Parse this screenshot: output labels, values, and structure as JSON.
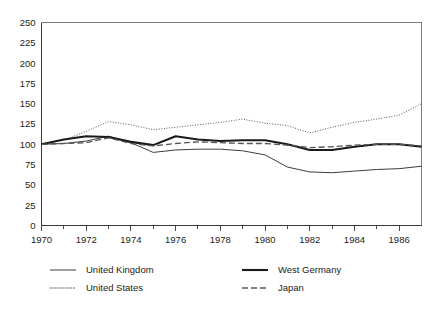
{
  "chart_data": {
    "type": "line",
    "title": "",
    "subtitle": "",
    "xlabel": "",
    "ylabel": "",
    "xlim": [
      1970,
      1987
    ],
    "ylim": [
      0,
      250
    ],
    "ytick_step": 25,
    "grid": false,
    "legend_position": "bottom",
    "yticks": [
      0,
      25,
      50,
      75,
      100,
      125,
      150,
      175,
      200,
      225,
      250
    ],
    "ytick_labels": [
      "0",
      "25",
      "50",
      "75",
      "100",
      "125",
      "150",
      "175",
      "200",
      "225",
      "250"
    ],
    "xticks": [
      1970,
      1971,
      1972,
      1973,
      1974,
      1975,
      1976,
      1977,
      1978,
      1979,
      1980,
      1981,
      1982,
      1983,
      1984,
      1985,
      1986,
      1987
    ],
    "xtick_labels_major": [
      "1970",
      "1972",
      "1974",
      "1976",
      "1978",
      "1980",
      "1982",
      "1984",
      "1986"
    ],
    "x": [
      1970,
      1971,
      1972,
      1973,
      1974,
      1975,
      1976,
      1977,
      1978,
      1979,
      1980,
      1981,
      1982,
      1983,
      1984,
      1985,
      1986,
      1987
    ],
    "series": [
      {
        "name": "United Kingdom",
        "style": "thin-solid",
        "color": "#3d3d3d",
        "width": 1,
        "dash": "none",
        "values": [
          100,
          101,
          104,
          110,
          102,
          90,
          93,
          94,
          94,
          92,
          87,
          72,
          66,
          65,
          67,
          69,
          70,
          73
        ]
      },
      {
        "name": "United States",
        "style": "dotted",
        "color": "#5a5a5a",
        "width": 1,
        "dash": "1,1.6",
        "values": [
          100,
          105,
          116,
          128,
          124,
          118,
          121,
          124,
          127,
          131,
          126,
          123,
          114,
          121,
          127,
          131,
          136,
          150
        ]
      },
      {
        "name": "West Germany",
        "style": "thick-solid",
        "color": "#1a1a1a",
        "width": 2.1,
        "dash": "none",
        "values": [
          100,
          106,
          110,
          109,
          103,
          99,
          110,
          106,
          104,
          105,
          105,
          100,
          93,
          93,
          97,
          100,
          100,
          97
        ]
      },
      {
        "name": "Japan",
        "style": "dashed",
        "color": "#555555",
        "width": 1.3,
        "dash": "6,3",
        "values": [
          100,
          101,
          102,
          108,
          101,
          98,
          101,
          103,
          102,
          101,
          101,
          99,
          96,
          97,
          99,
          100,
          100,
          98
        ]
      }
    ]
  },
  "legend": {
    "entries": [
      {
        "label": "United Kingdom",
        "series": "United Kingdom"
      },
      {
        "label": "West Germany",
        "series": "West Germany"
      },
      {
        "label": "United States",
        "series": "United States"
      },
      {
        "label": "Japan",
        "series": "Japan"
      }
    ]
  },
  "axis": {
    "y_labels": [
      "250",
      "225",
      "200",
      "175",
      "150",
      "125",
      "100",
      "75",
      "50",
      "25",
      "0"
    ],
    "x_labels": [
      "1970",
      "1972",
      "1974",
      "1976",
      "1978",
      "1980",
      "1982",
      "1984",
      "1986"
    ]
  }
}
